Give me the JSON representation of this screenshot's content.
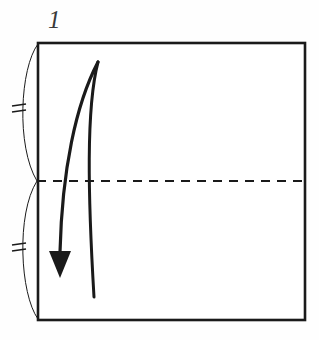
{
  "figure": {
    "title_label": "1",
    "kind": "origami-fold-step",
    "background_color": "#fefefe",
    "ink_color": "#1a1a1a",
    "label_color": "#3a3a3a"
  },
  "paper": {
    "shape_name": "square-sheet",
    "left": 38,
    "top": 43,
    "right": 305,
    "bottom": 320,
    "stroke_width": 2.6,
    "fill": "#ffffff"
  },
  "crease": {
    "name": "horizontal-valley-crease",
    "style": "dashed",
    "y": 181,
    "x_start": 37,
    "x_end": 305,
    "dash_pattern": "9 7",
    "stroke_width": 2.2
  },
  "edge_arcs": [
    {
      "name": "upper-edge-measure-arc",
      "from_x": 38,
      "from_y": 44,
      "bulge_x": 18,
      "bulge_y": 112,
      "to_x": 37,
      "to_y": 181,
      "stroke_width": 1.0
    },
    {
      "name": "lower-edge-measure-arc",
      "from_x": 37,
      "from_y": 181,
      "bulge_x": 18,
      "bulge_y": 250,
      "to_x": 38,
      "to_y": 319,
      "stroke_width": 1.0
    }
  ],
  "equal_marks": [
    {
      "name": "upper-equal-tick-1",
      "x1": 12,
      "y1": 106,
      "x2": 26,
      "y2": 104
    },
    {
      "name": "upper-equal-tick-2",
      "x1": 12,
      "y1": 112,
      "x2": 26,
      "y2": 110
    },
    {
      "name": "lower-equal-tick-1",
      "x1": 12,
      "y1": 245,
      "x2": 26,
      "y2": 243
    },
    {
      "name": "lower-equal-tick-2",
      "x1": 12,
      "y1": 251,
      "x2": 26,
      "y2": 249
    }
  ],
  "fold_arrow": {
    "name": "fold-down-arrow",
    "direction": "down",
    "shaft_path": "M 98 62 C 76 104, 62 170, 60 252",
    "return_path": "M 98 62 C 86 108, 88 196, 94 297",
    "shaft_width": 3.2,
    "head": {
      "tip_x": 60,
      "tip_y": 278,
      "left_x": 49,
      "left_y": 251,
      "right_x": 71,
      "right_y": 251
    }
  },
  "step_label": {
    "name": "step-number",
    "text": "1",
    "x": 48,
    "y": 28
  }
}
